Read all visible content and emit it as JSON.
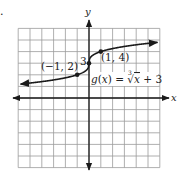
{
  "figure_marker": ".",
  "chart_data": {
    "type": "line",
    "title": "",
    "xlabel": "x",
    "ylabel": "y",
    "xlim": [
      -6,
      6
    ],
    "ylim": [
      -6,
      6
    ],
    "grid": true,
    "function_label": "g(x) = ∛x + 3",
    "function_label_parts": {
      "lhs": "g(x) = ",
      "index": "3",
      "radicand": "x",
      "rest": " + 3"
    },
    "series": [
      {
        "name": "g(x) = cbrt(x) + 3",
        "x": [
          -6,
          -4,
          -2,
          -1,
          -0.5,
          -0.125,
          0,
          0.125,
          0.5,
          1,
          2,
          4,
          6
        ],
        "values": [
          1.18,
          1.41,
          1.74,
          2,
          2.21,
          2.5,
          3,
          3.5,
          3.79,
          4,
          4.26,
          4.59,
          4.82
        ]
      }
    ],
    "annotations": [
      {
        "text": "(−1, 2)",
        "x": -1,
        "y": 2
      },
      {
        "text": "3",
        "x": 0,
        "y": 3
      },
      {
        "text": "(1, 4)",
        "x": 1,
        "y": 4
      }
    ],
    "points": [
      {
        "x": -1,
        "y": 2
      },
      {
        "x": 0,
        "y": 3
      },
      {
        "x": 1,
        "y": 4
      }
    ]
  },
  "colors": {
    "ink": "#1a1a1a",
    "grid": "#9a9a9a",
    "background": "#ffffff"
  }
}
